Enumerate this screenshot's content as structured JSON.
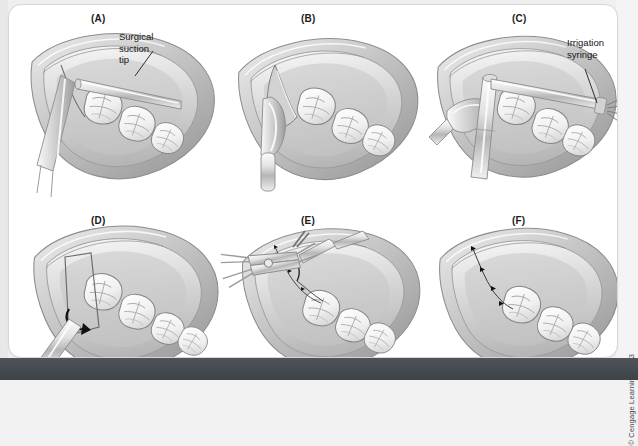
{
  "figure": {
    "title_caption": "",
    "credit": "© Cengage Learning 2013",
    "background_color": "#efefef",
    "card_color": "#ffffff",
    "bottom_bar_color": "#454b52",
    "ink_color": "#1c1c1c"
  },
  "panels": [
    {
      "id": "A",
      "label": "(A)",
      "callout": "Surgical\nsuction tip",
      "description": "Mandibular arch with soft tissue flap retracted; surgical suction tip and retractor in place"
    },
    {
      "id": "B",
      "label": "(B)",
      "callout": "",
      "description": "Periosteal elevator reflecting the full-thickness mucoperiosteal flap"
    },
    {
      "id": "C",
      "label": "(C)",
      "callout": "Irrigation\nsyringe",
      "description": "Irrigation syringe and suction used to flush the surgical site"
    },
    {
      "id": "D",
      "label": "(D)",
      "callout": "",
      "description": "Flap repositioned over the bone, arrow indicating tissue replacement direction"
    },
    {
      "id": "E",
      "label": "(E)",
      "callout": "",
      "description": "Needle holder and tissue forceps placing interrupted sutures"
    },
    {
      "id": "F",
      "label": "(F)",
      "callout": "",
      "description": "Completed suture line closing the surgical site"
    }
  ]
}
